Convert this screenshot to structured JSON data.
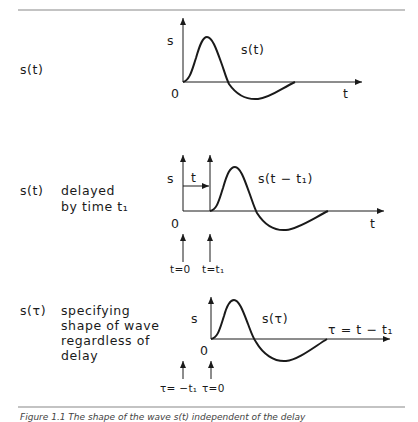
{
  "figure": {
    "caption": "Figure 1.1 The shape of the wave s(t) independent of the delay",
    "stroke_color": "#1a1a1a",
    "rule_color": "#888888",
    "panels": [
      {
        "id": "original",
        "left_label": "s(t)",
        "description": "",
        "y_axis_label": "s",
        "curve_label": "s(t)",
        "origin_label": "0",
        "x_axis_label": "t"
      },
      {
        "id": "delayed",
        "left_label": "s(t)",
        "description_line1": "delayed",
        "description_line2": "by time t₁",
        "y_axis_label": "s",
        "delay_label": "t",
        "curve_label": "s(t − t₁)",
        "origin_label": "0",
        "x_axis_label": "t",
        "marker_labels": [
          "t=0",
          "t=t₁"
        ]
      },
      {
        "id": "shape",
        "left_label": "s(τ)",
        "description_lines": [
          "specifying",
          "shape of wave",
          "regardless of",
          "delay"
        ],
        "y_axis_label": "s",
        "curve_label": "s(τ)",
        "origin_label": "0",
        "x_axis_label": "τ = t − t₁",
        "marker_labels": [
          "τ= −t₁",
          "τ=0"
        ]
      }
    ]
  }
}
